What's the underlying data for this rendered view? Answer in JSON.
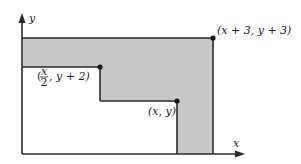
{
  "diagram": {
    "axes": {
      "x_label": "x",
      "y_label": "y"
    },
    "colors": {
      "shade": "#c8c8c8",
      "line": "#2a2a2a",
      "background": "#ffffff"
    },
    "points": [
      {
        "id": "top-right",
        "label": "(x + 3, y + 3)"
      },
      {
        "id": "mid-step",
        "label_open": "(",
        "frac_num": "x",
        "frac_den": "2",
        "label_rest": ", y + 2)"
      },
      {
        "id": "base",
        "label": "(x, y)"
      }
    ]
  }
}
